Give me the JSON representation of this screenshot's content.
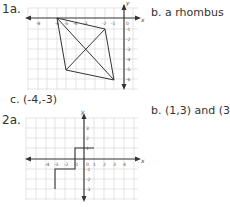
{
  "problems": [
    {
      "label": "1a.",
      "answer_b": "b.  a rhombus",
      "answer_c": "c.  (-4,-3)",
      "graph": {
        "axis_x_label": "x",
        "axis_y_label": "y",
        "x_ticks": [
          "-8",
          "-7",
          "-6",
          "-5",
          "-4",
          "-3",
          "-2",
          "-1",
          "0"
        ],
        "y_ticks": [
          "-1",
          "-2",
          "-3",
          "-4",
          "-5",
          "-6"
        ],
        "vertices": [
          [
            -7,
            0
          ],
          [
            -2,
            -1
          ],
          [
            -1,
            -6
          ],
          [
            -6,
            -5
          ]
        ]
      }
    },
    {
      "label": "2a.",
      "answer_b": "b.  (1,3) and (3,3)",
      "graph": {
        "axis_x_label": "x",
        "axis_y_label": "y",
        "x_ticks": [
          "-4",
          "-3",
          "-2",
          "-1",
          "0",
          "1",
          "2",
          "3",
          "4"
        ],
        "y_ticks": [
          "3",
          "2",
          "1",
          "-1",
          "-2",
          "-3"
        ],
        "path": [
          [
            -3,
            -3
          ],
          [
            -3,
            -1
          ],
          [
            -1,
            -1
          ],
          [
            -1,
            1
          ],
          [
            1,
            1
          ]
        ]
      }
    }
  ],
  "colors": {
    "grid": "#d8d8d8",
    "line": "#333333",
    "text": "#444444"
  }
}
